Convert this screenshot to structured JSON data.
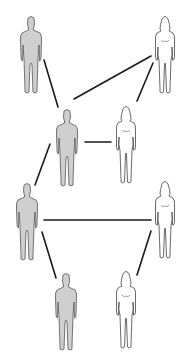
{
  "diagram": {
    "title": "",
    "figures": [
      {
        "id": "m1",
        "sex": "male",
        "x": 31,
        "y": 55,
        "label": ""
      },
      {
        "id": "f1",
        "sex": "female",
        "x": 165,
        "y": 55,
        "label": ""
      },
      {
        "id": "m2",
        "sex": "male",
        "x": 67,
        "y": 148,
        "label": ""
      },
      {
        "id": "f2",
        "sex": "female",
        "x": 126,
        "y": 145,
        "label": ""
      },
      {
        "id": "m3",
        "sex": "male",
        "x": 27,
        "y": 222,
        "label": ""
      },
      {
        "id": "f3",
        "sex": "female",
        "x": 165,
        "y": 220,
        "label": ""
      },
      {
        "id": "m4",
        "sex": "male",
        "x": 66,
        "y": 312,
        "label": ""
      },
      {
        "id": "f4",
        "sex": "female",
        "x": 126,
        "y": 310,
        "label": ""
      }
    ],
    "edges": [
      {
        "from": "m1",
        "to": "m2",
        "x1": 44,
        "y1": 60,
        "x2": 58,
        "y2": 107
      },
      {
        "from": "m2",
        "to": "f1",
        "x1": 74,
        "y1": 99,
        "x2": 151,
        "y2": 56
      },
      {
        "from": "f1",
        "to": "f2",
        "x1": 153,
        "y1": 63,
        "x2": 137,
        "y2": 101
      },
      {
        "from": "m2",
        "to": "f2",
        "x1": 85,
        "y1": 142,
        "x2": 111,
        "y2": 142
      },
      {
        "from": "m2",
        "to": "m3",
        "x1": 50,
        "y1": 144,
        "x2": 35,
        "y2": 185
      },
      {
        "from": "m3",
        "to": "f3",
        "x1": 44,
        "y1": 220,
        "x2": 151,
        "y2": 220
      },
      {
        "from": "m3",
        "to": "m4",
        "x1": 42,
        "y1": 232,
        "x2": 56,
        "y2": 278
      },
      {
        "from": "f3",
        "to": "f4",
        "x1": 151,
        "y1": 231,
        "x2": 137,
        "y2": 275
      }
    ],
    "colors": {
      "background": "#ffffff",
      "line": "#1a1a1a",
      "male_fill": "#cfcfcf",
      "male_stroke": "#555555",
      "female_fill": "#ffffff",
      "female_stroke": "#444444"
    }
  }
}
